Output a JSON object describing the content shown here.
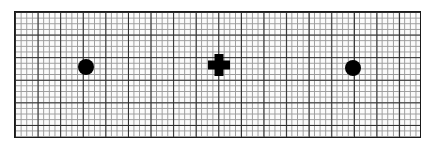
{
  "figure": {
    "background_color": "#ffffff",
    "width": 432,
    "height": 149
  },
  "grid": {
    "label": "graph-paper-grid",
    "left": 14,
    "top": 11,
    "width": 407,
    "height": 127,
    "cell_size": 5.65,
    "major_every": 4,
    "columns": 72,
    "rows": 22,
    "fine_line_color": "#9a9a9a",
    "major_line_color": "#2b2b2b",
    "border_color": "#1a1a1a",
    "border_width": 1.6,
    "fill_color": "#fbfbfb"
  },
  "markers": [
    {
      "id": "left-dot",
      "shape": "circle",
      "label": "Left filled circle",
      "cx": 85,
      "cy": 66,
      "diameter": 16,
      "color": "#000000"
    },
    {
      "id": "center-cross",
      "shape": "cross",
      "label": "Center plus sign",
      "cx": 218,
      "cy": 64,
      "size": 22,
      "arm_thickness": 9,
      "color": "#000000"
    },
    {
      "id": "right-dot",
      "shape": "circle",
      "label": "Right filled circle",
      "cx": 352,
      "cy": 67,
      "diameter": 16,
      "color": "#000000"
    }
  ],
  "chart_data": {
    "type": "scatter",
    "title": "",
    "xlabel": "",
    "ylabel": "",
    "grid": true,
    "legend": "none",
    "xlim": [
      0,
      72
    ],
    "ylim": [
      0,
      22
    ],
    "points": [
      {
        "label": "left-dot",
        "marker": "circle",
        "x": 12.6,
        "y": 12.3
      },
      {
        "label": "center-cross",
        "marker": "plus",
        "x": 36.1,
        "y": 12.6
      },
      {
        "label": "right-dot",
        "marker": "circle",
        "x": 59.8,
        "y": 12.1
      }
    ],
    "series": [
      {
        "name": "markers",
        "values": [
          12.3,
          12.6,
          12.1
        ]
      }
    ],
    "categories": [
      "left-dot",
      "center-cross",
      "right-dot"
    ]
  }
}
